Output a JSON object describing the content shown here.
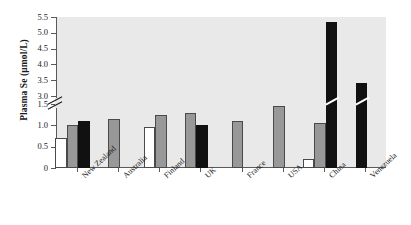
{
  "chart_data": {
    "type": "bar",
    "title": "",
    "xlabel": "",
    "ylabel": "Plasma Se (µmol/L)",
    "ylim": [
      0,
      5.5
    ],
    "axis_break": {
      "low": 1.5,
      "high": 3.0,
      "note": "y-axis broken between 1.5 and 3.0"
    },
    "grid": false,
    "legend": "none",
    "y_ticks": [
      "0",
      "0.5",
      "1.0",
      "1.5",
      "3.0",
      "3.5",
      "4.0",
      "4.5",
      "5.0",
      "5.5"
    ],
    "categories": [
      "New Zealand",
      "Australia",
      "Finland",
      "UK",
      "France",
      "USA",
      "China",
      "Venezuela"
    ],
    "series": [
      {
        "name": "white-bar",
        "fill": "white",
        "values": [
          0.7,
          null,
          0.95,
          null,
          null,
          null,
          0.2,
          null
        ]
      },
      {
        "name": "gray-bar",
        "fill": "gray",
        "values": [
          1.0,
          1.15,
          1.25,
          1.3,
          1.1,
          1.45,
          1.05,
          null
        ]
      },
      {
        "name": "black-bar",
        "fill": "black",
        "values": [
          1.1,
          null,
          null,
          1.0,
          null,
          null,
          5.35,
          3.4
        ]
      }
    ],
    "colors": {
      "white": "#ffffff",
      "gray": "#989898",
      "black": "#111111",
      "plot_background": "#e9e9e9",
      "axis": "#5a5a5a"
    }
  }
}
